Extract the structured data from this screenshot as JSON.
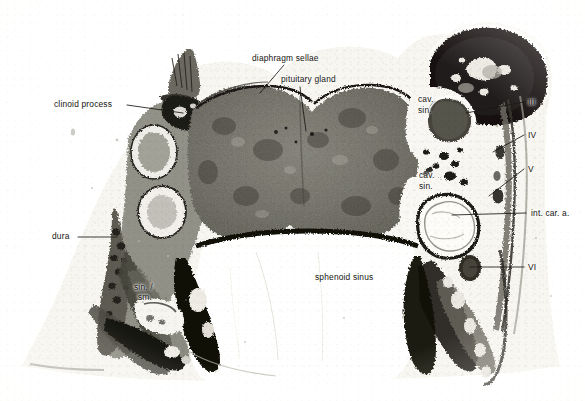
{
  "figure": {
    "kind": "histologic-section-photomicrograph",
    "width_px": 585,
    "height_px": 401,
    "background_color": "#fdfdfc",
    "ink_color": "#15130f"
  },
  "labels": {
    "diaphragm_sellae": "diaphragm sellae",
    "pituitary_gland": "pituitary gland",
    "clinoid_process": "clinoid process",
    "dura": "dura",
    "sphenoid_sinus": "sphenoid sinus",
    "int_car_a": "int. car. a.",
    "cav_sin_upper_line1": "cav.",
    "cav_sin_upper_line2": "sin.",
    "cav_sin_lower_line1": "cav.",
    "cav_sin_lower_line2": "sin.",
    "sin_sm_line1": "sin. /",
    "sin_sm_line2": "sm.",
    "nerve_iii": "III",
    "nerve_iv": "IV",
    "nerve_v": "V",
    "nerve_vi": "VI"
  },
  "structures": [
    {
      "name": "pituitary gland",
      "appearance": "large dark granular bilobed mass occupying the sella"
    },
    {
      "name": "diaphragm sellae",
      "appearance": "thin dark membrane roofing the pituitary fossa"
    },
    {
      "name": "clinoid process",
      "appearance": "bony process on the left superior aspect"
    },
    {
      "name": "dura",
      "appearance": "thick dark fibrous sheet on the left lateral wall"
    },
    {
      "name": "sphenoid sinus",
      "appearance": "large pale air-filled cavity beneath the sella"
    },
    {
      "name": "cavernous sinus",
      "appearance": "paired venous spaces lateral to the pituitary, upper and lower"
    },
    {
      "name": "internal carotid artery",
      "appearance": "round lumen within the right cavernous sinus"
    },
    {
      "name": "cranial nerve III",
      "appearance": "dark oval nerve cross-section, superolateral"
    },
    {
      "name": "cranial nerve IV",
      "appearance": "small nerve cross-section below III"
    },
    {
      "name": "cranial nerve V",
      "appearance": "nerve cross-section below IV"
    },
    {
      "name": "cranial nerve VI",
      "appearance": "dark oval nerve cross-section medial, near carotid"
    },
    {
      "name": "small sinus",
      "appearance": "small venous channel in the left inferior region"
    }
  ]
}
